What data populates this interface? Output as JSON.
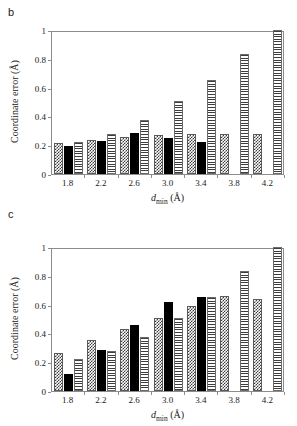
{
  "figure": {
    "panels": [
      {
        "label": "b",
        "axis": {
          "ylabel_prefix": "Coordinate error (",
          "ylabel_unit": "Å",
          "ylabel_suffix": ")",
          "xlabel_symbol": "d",
          "xlabel_sub": "min",
          "xlabel_unit": " (Å)",
          "yticks": [
            "0",
            "0.2",
            "0.4",
            "0.6",
            "0.8",
            "1"
          ],
          "xticks": [
            "1.8",
            "2.2",
            "2.6",
            "3.0",
            "3.4",
            "3.8",
            "4.2"
          ]
        }
      },
      {
        "label": "c",
        "axis": {
          "ylabel_prefix": "Coordinate error (",
          "ylabel_unit": "Å",
          "ylabel_suffix": ")",
          "xlabel_symbol": "d",
          "xlabel_sub": "min",
          "xlabel_unit": " (Å)",
          "yticks": [
            "0",
            "0.2",
            "0.4",
            "0.6",
            "0.8",
            "1"
          ],
          "xticks": [
            "1.8",
            "2.2",
            "2.6",
            "3.0",
            "3.4",
            "3.8",
            "4.2"
          ]
        }
      }
    ]
  },
  "chart_data": [
    {
      "type": "bar",
      "panel": "b",
      "title": "",
      "xlabel": "d_min (Å)",
      "ylabel": "Coordinate error (Å)",
      "categories": [
        "1.8",
        "2.2",
        "2.6",
        "3.0",
        "3.4",
        "3.8",
        "4.2"
      ],
      "ylim": [
        0,
        1
      ],
      "xlim_note": "categorical, 7 groups",
      "grid": false,
      "legend": "none",
      "series": [
        {
          "name": "checkerboard",
          "pattern": "checker",
          "values": [
            0.215,
            0.235,
            0.26,
            0.27,
            0.275,
            0.275,
            0.275
          ]
        },
        {
          "name": "solid-black",
          "pattern": "solid",
          "values": [
            0.195,
            0.23,
            0.285,
            0.25,
            0.225,
            null,
            null
          ]
        },
        {
          "name": "horizontal-stripes",
          "pattern": "stripe",
          "values": [
            0.225,
            0.28,
            0.375,
            0.505,
            0.655,
            0.835,
            1.0
          ]
        }
      ]
    },
    {
      "type": "bar",
      "panel": "c",
      "title": "",
      "xlabel": "d_min (Å)",
      "ylabel": "Coordinate error (Å)",
      "categories": [
        "1.8",
        "2.2",
        "2.6",
        "3.0",
        "3.4",
        "3.8",
        "4.2"
      ],
      "ylim": [
        0,
        1
      ],
      "xlim_note": "categorical, 7 groups",
      "grid": false,
      "legend": "none",
      "series": [
        {
          "name": "checkerboard",
          "pattern": "checker",
          "values": [
            0.265,
            0.355,
            0.43,
            0.505,
            0.59,
            0.66,
            0.64
          ]
        },
        {
          "name": "solid-black",
          "pattern": "solid",
          "values": [
            0.115,
            0.285,
            0.46,
            0.62,
            0.655,
            null,
            null
          ]
        },
        {
          "name": "horizontal-stripes",
          "pattern": "stripe",
          "values": [
            0.225,
            0.28,
            0.375,
            0.505,
            0.655,
            0.835,
            1.0
          ]
        }
      ]
    }
  ],
  "colors": {
    "frame": "#8c8c8c",
    "bar_dark": "#3d3d3d",
    "bar_solid": "#000000",
    "background": "#ffffff",
    "text": "#1a1a1a"
  }
}
